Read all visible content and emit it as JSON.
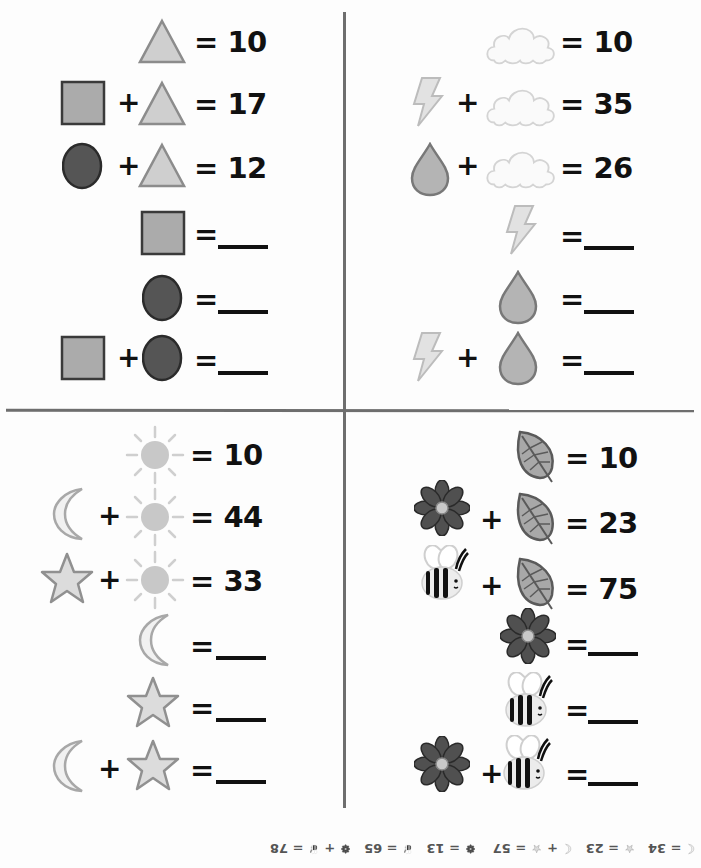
{
  "quadrants": {
    "shapes": {
      "equations": [
        {
          "terms": [
            "triangle"
          ],
          "result": "= 10"
        },
        {
          "terms": [
            "square",
            "triangle"
          ],
          "result": "= 17"
        },
        {
          "terms": [
            "circle",
            "triangle"
          ],
          "result": "= 12"
        },
        {
          "terms": [
            "square"
          ],
          "result": "="
        },
        {
          "terms": [
            "circle"
          ],
          "result": "="
        },
        {
          "terms": [
            "square",
            "circle"
          ],
          "result": "="
        }
      ]
    },
    "weather": {
      "equations": [
        {
          "terms": [
            "cloud"
          ],
          "result": "= 10"
        },
        {
          "terms": [
            "lightning",
            "cloud"
          ],
          "result": "= 35"
        },
        {
          "terms": [
            "raindrop",
            "cloud"
          ],
          "result": "= 26"
        },
        {
          "terms": [
            "lightning"
          ],
          "result": "="
        },
        {
          "terms": [
            "raindrop"
          ],
          "result": "="
        },
        {
          "terms": [
            "lightning",
            "raindrop"
          ],
          "result": "="
        }
      ]
    },
    "sky": {
      "equations": [
        {
          "terms": [
            "sun"
          ],
          "result": "= 10"
        },
        {
          "terms": [
            "moon",
            "sun"
          ],
          "result": "= 44"
        },
        {
          "terms": [
            "star",
            "sun"
          ],
          "result": "= 33"
        },
        {
          "terms": [
            "moon"
          ],
          "result": "="
        },
        {
          "terms": [
            "star"
          ],
          "result": "="
        },
        {
          "terms": [
            "moon",
            "star"
          ],
          "result": "="
        }
      ]
    },
    "garden": {
      "equations": [
        {
          "terms": [
            "leaf"
          ],
          "result": "= 10"
        },
        {
          "terms": [
            "flower",
            "leaf"
          ],
          "result": "= 23"
        },
        {
          "terms": [
            "bee",
            "leaf"
          ],
          "result": "= 75"
        },
        {
          "terms": [
            "flower"
          ],
          "result": "="
        },
        {
          "terms": [
            "bee"
          ],
          "result": "="
        },
        {
          "terms": [
            "flower",
            "bee"
          ],
          "result": "="
        }
      ]
    }
  },
  "plus_sign": "+",
  "answer_key": {
    "orientation": "upside-down",
    "items": [
      "= 34",
      "= 23",
      "+",
      "= 57",
      "= 13",
      "= 65",
      "+",
      "= 78"
    ]
  },
  "colors": {
    "triangle": "#c8c8c8",
    "square": "#a9a9a9",
    "circle": "#555555",
    "outline": "#888888",
    "ink": "#111111",
    "divider": "#6e6e6e"
  }
}
